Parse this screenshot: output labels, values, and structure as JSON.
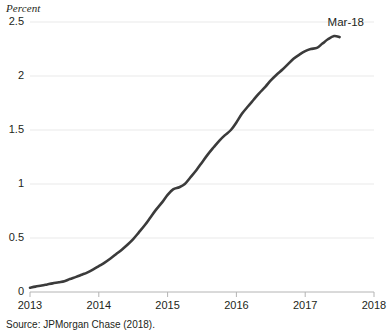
{
  "chart_data": {
    "type": "line",
    "title": "",
    "subtitle": "",
    "xlabel": "",
    "ylabel": "Percent",
    "ylabel_style": "italic",
    "xlim": [
      2013,
      2018
    ],
    "ylim": [
      0,
      2.5
    ],
    "grid": true,
    "grid_axis": "y",
    "legend": "none",
    "yticks": [
      "0",
      "0.5",
      "1",
      "1.5",
      "2",
      "2.5"
    ],
    "ytick_values": [
      0,
      0.5,
      1,
      1.5,
      2,
      2.5
    ],
    "xticks": [
      "2013",
      "2014",
      "2015",
      "2016",
      "2017",
      "2018"
    ],
    "xtick_values": [
      2013,
      2014,
      2015,
      2016,
      2017,
      2018
    ],
    "series": [
      {
        "name": "share",
        "color": "#3b3b3b",
        "line_width": 2.6,
        "x": [
          2013.0,
          2013.08,
          2013.17,
          2013.25,
          2013.33,
          2013.42,
          2013.5,
          2013.58,
          2013.67,
          2013.75,
          2013.83,
          2013.92,
          2014.0,
          2014.08,
          2014.17,
          2014.25,
          2014.33,
          2014.42,
          2014.5,
          2014.58,
          2014.67,
          2014.75,
          2014.83,
          2014.92,
          2015.0,
          2015.08,
          2015.17,
          2015.25,
          2015.33,
          2015.42,
          2015.5,
          2015.58,
          2015.67,
          2015.75,
          2015.83,
          2015.92,
          2016.0,
          2016.08,
          2016.17,
          2016.25,
          2016.33,
          2016.42,
          2016.5,
          2016.58,
          2016.67,
          2016.75,
          2016.83,
          2016.92,
          2017.0,
          2017.08,
          2017.17,
          2017.25,
          2017.33,
          2017.42,
          2017.5
        ],
        "y": [
          0.04,
          0.05,
          0.06,
          0.07,
          0.08,
          0.09,
          0.1,
          0.12,
          0.14,
          0.16,
          0.18,
          0.21,
          0.24,
          0.27,
          0.31,
          0.35,
          0.39,
          0.44,
          0.49,
          0.55,
          0.62,
          0.69,
          0.76,
          0.83,
          0.9,
          0.95,
          0.97,
          1.0,
          1.06,
          1.13,
          1.2,
          1.27,
          1.34,
          1.4,
          1.45,
          1.5,
          1.57,
          1.65,
          1.72,
          1.78,
          1.84,
          1.9,
          1.96,
          2.01,
          2.06,
          2.11,
          2.16,
          2.2,
          2.23,
          2.25,
          2.26,
          2.3,
          2.34,
          2.37,
          2.36
        ]
      }
    ],
    "annotations": [
      {
        "text": "Mar-18",
        "x": 2017.5,
        "y": 2.36,
        "position": "above-right"
      }
    ],
    "source_note": "Source: JPMorgan Chase (2018)."
  },
  "colors": {
    "line": "#3b3b3b",
    "grid": "#e9e9e9",
    "axis": "#b4b4b4",
    "text": "#231f20",
    "background": "#ffffff"
  }
}
